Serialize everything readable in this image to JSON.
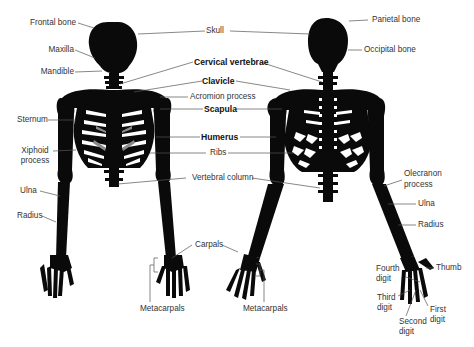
{
  "diagram": {
    "views": [
      "anterior",
      "posterior"
    ]
  },
  "labels": {
    "frontal_bone": "Frontal bone",
    "maxilla": "Maxilla",
    "mandible": "Mandible",
    "sternum": "Sternum",
    "xiphoid_1": "Xiphoid",
    "xiphoid_2": "process",
    "ulna_left": "Ulna",
    "radius_left": "Radius",
    "skull": "Skull",
    "cervical_vertebrae": "Cervical vertebrae",
    "clavicle": "Clavicle",
    "acromion_process": "Acromion process",
    "scapula": "Scapula",
    "humerus": "Humerus",
    "ribs": "Ribs",
    "vertebral_column": "Vertebral column",
    "carpals": "Carpals",
    "metacarpals_left": "Metacarpals",
    "metacarpals_right": "Metacarpals",
    "parietal_bone": "Parietal bone",
    "occipital_bone": "Occipital bone",
    "olecranon_1": "Olecranon",
    "olecranon_2": "process",
    "ulna_right": "Ulna",
    "radius_right": "Radius",
    "fourth_digit_1": "Fourth",
    "fourth_digit_2": "digit",
    "third_digit_1": "Third",
    "third_digit_2": "digit",
    "second_digit_1": "Second",
    "second_digit_2": "digit",
    "first_digit_1": "First",
    "first_digit_2": "digit",
    "thumb": "Thumb"
  },
  "colors": {
    "bone": "#0a0a0a",
    "cartilage": "#8a8a8a",
    "leader_line": "#555555",
    "text": "#333333"
  }
}
